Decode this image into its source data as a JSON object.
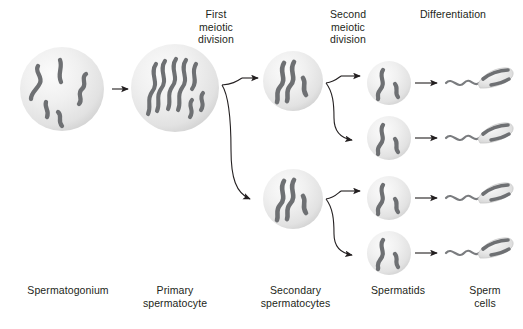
{
  "diagram": {
    "background_color": "#ffffff",
    "chromosome_color": "#6e7073",
    "chromosome_dark_color": "#58595b",
    "cell_fill_light": "#f2f2f2",
    "cell_fill_mid": "#e3e3e3",
    "cell_fill_edge": "#cfcfcf",
    "arrow_color": "#231f20",
    "text_color": "#231f20"
  },
  "process_labels": [
    {
      "id": "first-meiotic-division",
      "text": "First\nmeiotic\ndivision",
      "x": 186,
      "y": 8,
      "width": 60
    },
    {
      "id": "second-meiotic-division",
      "text": "Second\nmeiotic\ndivision",
      "x": 318,
      "y": 8,
      "width": 60
    },
    {
      "id": "differentiation",
      "text": "Differentiation",
      "x": 410,
      "y": 8,
      "width": 86
    }
  ],
  "stage_labels": [
    {
      "id": "spermatogonium",
      "text": "Spermatogonium",
      "x": 8,
      "y": 284,
      "width": 120
    },
    {
      "id": "primary-spermatocyte",
      "text": "Primary\nspermatocyte",
      "x": 120,
      "y": 284,
      "width": 110
    },
    {
      "id": "secondary-spermatocytes",
      "text": "Secondary\nspermatocytes",
      "x": 238,
      "y": 284,
      "width": 115
    },
    {
      "id": "spermatids",
      "text": "Spermatids",
      "x": 358,
      "y": 284,
      "width": 80
    },
    {
      "id": "sperm-cells",
      "text": "Sperm\ncells",
      "x": 456,
      "y": 284,
      "width": 58
    }
  ],
  "cells": [
    {
      "id": "spermatogonium-cell",
      "stage": "spermatogonium",
      "cx": 62,
      "cy": 89,
      "r": 42
    },
    {
      "id": "primary-spermatocyte-cell",
      "stage": "primary spermatocyte",
      "cx": 175,
      "cy": 88,
      "r": 44
    },
    {
      "id": "secondary-spermatocyte-cell-1",
      "stage": "secondary spermatocyte",
      "cx": 293,
      "cy": 81,
      "r": 30
    },
    {
      "id": "secondary-spermatocyte-cell-2",
      "stage": "secondary spermatocyte",
      "cx": 293,
      "cy": 199,
      "r": 30
    },
    {
      "id": "spermatid-cell-1",
      "stage": "spermatid",
      "cx": 389,
      "cy": 83,
      "r": 22
    },
    {
      "id": "spermatid-cell-2",
      "stage": "spermatid",
      "cx": 389,
      "cy": 138,
      "r": 22
    },
    {
      "id": "spermatid-cell-3",
      "stage": "spermatid",
      "cx": 389,
      "cy": 198,
      "r": 22
    },
    {
      "id": "spermatid-cell-4",
      "stage": "spermatid",
      "cx": 389,
      "cy": 253,
      "r": 22
    }
  ],
  "sperm_cells": [
    {
      "id": "sperm-cell-1",
      "x": 443,
      "y": 83
    },
    {
      "id": "sperm-cell-2",
      "x": 443,
      "y": 138
    },
    {
      "id": "sperm-cell-3",
      "x": 443,
      "y": 198
    },
    {
      "id": "sperm-cell-4",
      "x": 443,
      "y": 253
    }
  ],
  "arrows": [
    {
      "id": "arrow-spermatogonium-to-primary",
      "type": "straight"
    },
    {
      "id": "arrow-primary-to-secondary-upper",
      "type": "branch-up"
    },
    {
      "id": "arrow-primary-to-secondary-lower",
      "type": "branch-down"
    },
    {
      "id": "arrow-secondary1-to-spermatid1",
      "type": "branch-up"
    },
    {
      "id": "arrow-secondary1-to-spermatid2",
      "type": "branch-down"
    },
    {
      "id": "arrow-secondary2-to-spermatid3",
      "type": "branch-up"
    },
    {
      "id": "arrow-secondary2-to-spermatid4",
      "type": "branch-down"
    },
    {
      "id": "arrow-spermatid1-to-sperm1",
      "type": "straight"
    },
    {
      "id": "arrow-spermatid2-to-sperm2",
      "type": "straight"
    },
    {
      "id": "arrow-spermatid3-to-sperm3",
      "type": "straight"
    },
    {
      "id": "arrow-spermatid4-to-sperm4",
      "type": "straight"
    }
  ]
}
